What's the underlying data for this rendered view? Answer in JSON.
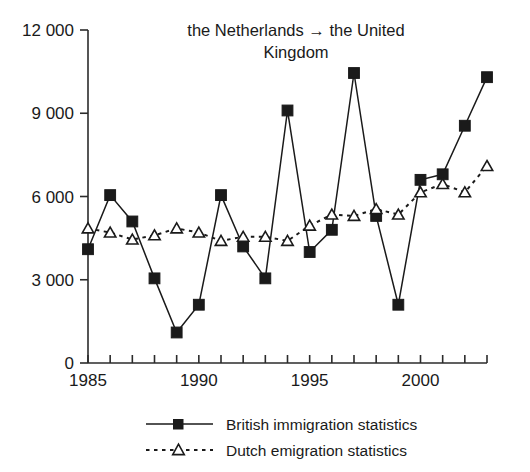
{
  "chart_data": {
    "type": "line",
    "title": "the Netherlands → the United Kingdom",
    "title_line1": "the Netherlands → the United",
    "title_line2": "Kingdom",
    "xlabel": "",
    "ylabel": "",
    "x": [
      1985,
      1986,
      1987,
      1988,
      1989,
      1990,
      1991,
      1992,
      1993,
      1994,
      1995,
      1996,
      1997,
      1998,
      1999,
      2000,
      2001,
      2002,
      2003
    ],
    "xlim": [
      1985,
      2003
    ],
    "ylim": [
      0,
      12000
    ],
    "yticks": [
      0,
      3000,
      6000,
      9000,
      12000
    ],
    "ytick_labels": [
      "0",
      "3 000",
      "6 000",
      "9 000",
      "12 000"
    ],
    "xticks": [
      1985,
      1986,
      1987,
      1988,
      1989,
      1990,
      1991,
      1992,
      1993,
      1994,
      1995,
      1996,
      1997,
      1998,
      1999,
      2000,
      2001,
      2002,
      2003
    ],
    "xtick_labels_major": [
      "1985",
      "1990",
      "1995",
      "2000"
    ],
    "xtick_major_values": [
      1985,
      1990,
      1995,
      2000
    ],
    "grid": false,
    "legend_position": "below-axes",
    "series": [
      {
        "name": "British immigration statistics",
        "marker": "filled-square",
        "line_style": "solid",
        "color": "#1a1a1a",
        "values": [
          4100,
          6050,
          5100,
          3050,
          1100,
          2100,
          6050,
          4200,
          3050,
          9100,
          4000,
          4800,
          10450,
          5300,
          2100,
          6600,
          6800,
          8550,
          10300
        ]
      },
      {
        "name": "Dutch emigration statistics",
        "marker": "open-triangle",
        "line_style": "dashed",
        "color": "#1a1a1a",
        "values": [
          4850,
          4700,
          4450,
          4600,
          4850,
          4700,
          4400,
          4550,
          4550,
          4400,
          4950,
          5350,
          5300,
          5550,
          5350,
          6150,
          6450,
          6150,
          7100
        ]
      }
    ]
  },
  "legend": {
    "items": [
      {
        "label": "British immigration statistics",
        "marker": "filled-square",
        "style": "solid"
      },
      {
        "label": "Dutch emigration statistics",
        "marker": "open-triangle",
        "style": "dashed"
      }
    ]
  }
}
